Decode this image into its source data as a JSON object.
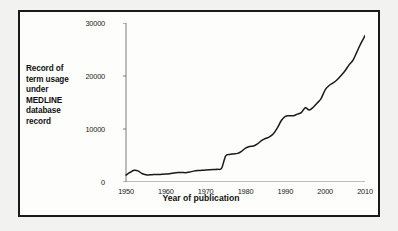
{
  "chart_data": {
    "type": "line",
    "title": "",
    "xlabel": "Year of publication",
    "ylabel": "Record of term usage under MEDLINE database record",
    "ylabel_lines": [
      "Record of",
      "term usage",
      "under",
      "MEDLINE",
      "database",
      "record"
    ],
    "xlim": [
      1950,
      2010
    ],
    "ylim": [
      0,
      30000
    ],
    "xticks": [
      1950,
      1960,
      1970,
      1980,
      1990,
      2000,
      2010
    ],
    "xtick_labels": [
      "1950",
      "1960",
      "1970",
      "1980",
      "1990",
      "2000",
      "2010"
    ],
    "yticks": [
      0,
      10000,
      20000,
      30000
    ],
    "ytick_labels": [
      "0",
      "10000",
      "20000",
      "30000"
    ],
    "grid": false,
    "legend": "none",
    "line_color": "#1a1a1a",
    "series": [
      {
        "name": "MEDLINE records",
        "x": [
          1950,
          1951,
          1952,
          1953,
          1954,
          1955,
          1956,
          1957,
          1958,
          1959,
          1960,
          1961,
          1962,
          1963,
          1964,
          1965,
          1966,
          1967,
          1968,
          1969,
          1970,
          1971,
          1972,
          1973,
          1974,
          1975,
          1976,
          1977,
          1978,
          1979,
          1980,
          1981,
          1982,
          1983,
          1984,
          1985,
          1986,
          1987,
          1988,
          1989,
          1990,
          1991,
          1992,
          1993,
          1994,
          1995,
          1996,
          1997,
          1998,
          1999,
          2000,
          2001,
          2002,
          2003,
          2004,
          2005,
          2006,
          2007,
          2008,
          2009,
          2010
        ],
        "values": [
          1300,
          1800,
          2200,
          2100,
          1600,
          1350,
          1350,
          1400,
          1400,
          1450,
          1500,
          1550,
          1700,
          1800,
          1800,
          1750,
          1900,
          2050,
          2150,
          2200,
          2250,
          2300,
          2350,
          2400,
          2600,
          4900,
          5200,
          5300,
          5400,
          5800,
          6400,
          6700,
          6800,
          7200,
          7800,
          8200,
          8500,
          9100,
          10200,
          11600,
          12400,
          12500,
          12500,
          12800,
          13100,
          14000,
          13600,
          14100,
          14900,
          15800,
          17400,
          18200,
          18700,
          19300,
          20100,
          21000,
          22100,
          23000,
          24600,
          26200,
          27600
        ]
      }
    ]
  }
}
